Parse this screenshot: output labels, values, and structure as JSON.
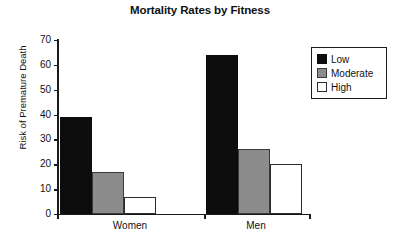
{
  "chart_data": {
    "type": "bar",
    "title": "Mortality Rates by Fitness",
    "xlabel": "",
    "ylabel": "Risk of Premature Death",
    "categories": [
      "Women",
      "Men"
    ],
    "series": [
      {
        "name": "Low",
        "color": "#0d0d0d",
        "values": [
          39,
          64
        ]
      },
      {
        "name": "Moderate",
        "color": "#8c8c8c",
        "values": [
          17,
          26
        ]
      },
      {
        "name": "High",
        "color": "#ffffff",
        "values": [
          7,
          20
        ]
      }
    ],
    "ylim": [
      0,
      70
    ],
    "yticks": [
      0,
      10,
      20,
      30,
      40,
      50,
      60,
      70
    ],
    "ytick_labels": [
      "0",
      "10",
      "20",
      "30",
      "40",
      "50",
      "60",
      "70"
    ],
    "grid": false,
    "legend_position": "right-top",
    "legend_entries": [
      "Low",
      "Moderate",
      "High"
    ]
  }
}
